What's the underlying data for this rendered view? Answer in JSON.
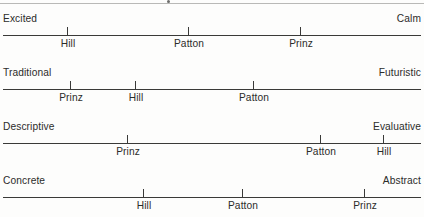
{
  "figure": {
    "type": "semantic-differential-scales",
    "items": [
      "Hill",
      "Patton",
      "Prinz"
    ],
    "scale_count": 4
  },
  "scales": [
    {
      "left_anchor": "Excited",
      "right_anchor": "Calm",
      "axis_top": 35,
      "anchor_top": 14,
      "label_top": 39,
      "marks": [
        {
          "name": "Hill",
          "x": 67
        },
        {
          "name": "Patton",
          "x": 188
        },
        {
          "name": "Prinz",
          "x": 300
        }
      ]
    },
    {
      "left_anchor": "Traditional",
      "right_anchor": "Futuristic",
      "axis_top": 89,
      "anchor_top": 68,
      "label_top": 93,
      "marks": [
        {
          "name": "Prinz",
          "x": 70
        },
        {
          "name": "Hill",
          "x": 135
        },
        {
          "name": "Patton",
          "x": 253
        }
      ]
    },
    {
      "left_anchor": "Descriptive",
      "right_anchor": "Evaluative",
      "axis_top": 143,
      "anchor_top": 122,
      "label_top": 147,
      "marks": [
        {
          "name": "Prinz",
          "x": 127
        },
        {
          "name": "Patton",
          "x": 320
        },
        {
          "name": "Hill",
          "x": 383
        }
      ]
    },
    {
      "left_anchor": "Concrete",
      "right_anchor": "Abstract",
      "axis_top": 197,
      "anchor_top": 176,
      "label_top": 201,
      "marks": [
        {
          "name": "Hill",
          "x": 143
        },
        {
          "name": "Patton",
          "x": 242
        },
        {
          "name": "Prinz",
          "x": 364
        }
      ]
    }
  ],
  "chart_data": {
    "type": "scatter",
    "title": "",
    "xlabel": "",
    "ylabel": "",
    "xlim": [
      0,
      100
    ],
    "grid": false,
    "legend": "none",
    "categories": [
      "Excited–Calm",
      "Traditional–Futuristic",
      "Descriptive–Evaluative",
      "Concrete–Abstract"
    ],
    "axes": [
      {
        "left_anchor": "Excited",
        "right_anchor": "Calm"
      },
      {
        "left_anchor": "Traditional",
        "right_anchor": "Futuristic"
      },
      {
        "left_anchor": "Descriptive",
        "right_anchor": "Evaluative"
      },
      {
        "left_anchor": "Concrete",
        "right_anchor": "Abstract"
      }
    ],
    "series": [
      {
        "name": "Hill",
        "values": [
          15,
          32,
          91,
          33
        ]
      },
      {
        "name": "Patton",
        "values": [
          44,
          60,
          76,
          57
        ]
      },
      {
        "name": "Prinz",
        "values": [
          71,
          16,
          30,
          86
        ]
      }
    ]
  }
}
